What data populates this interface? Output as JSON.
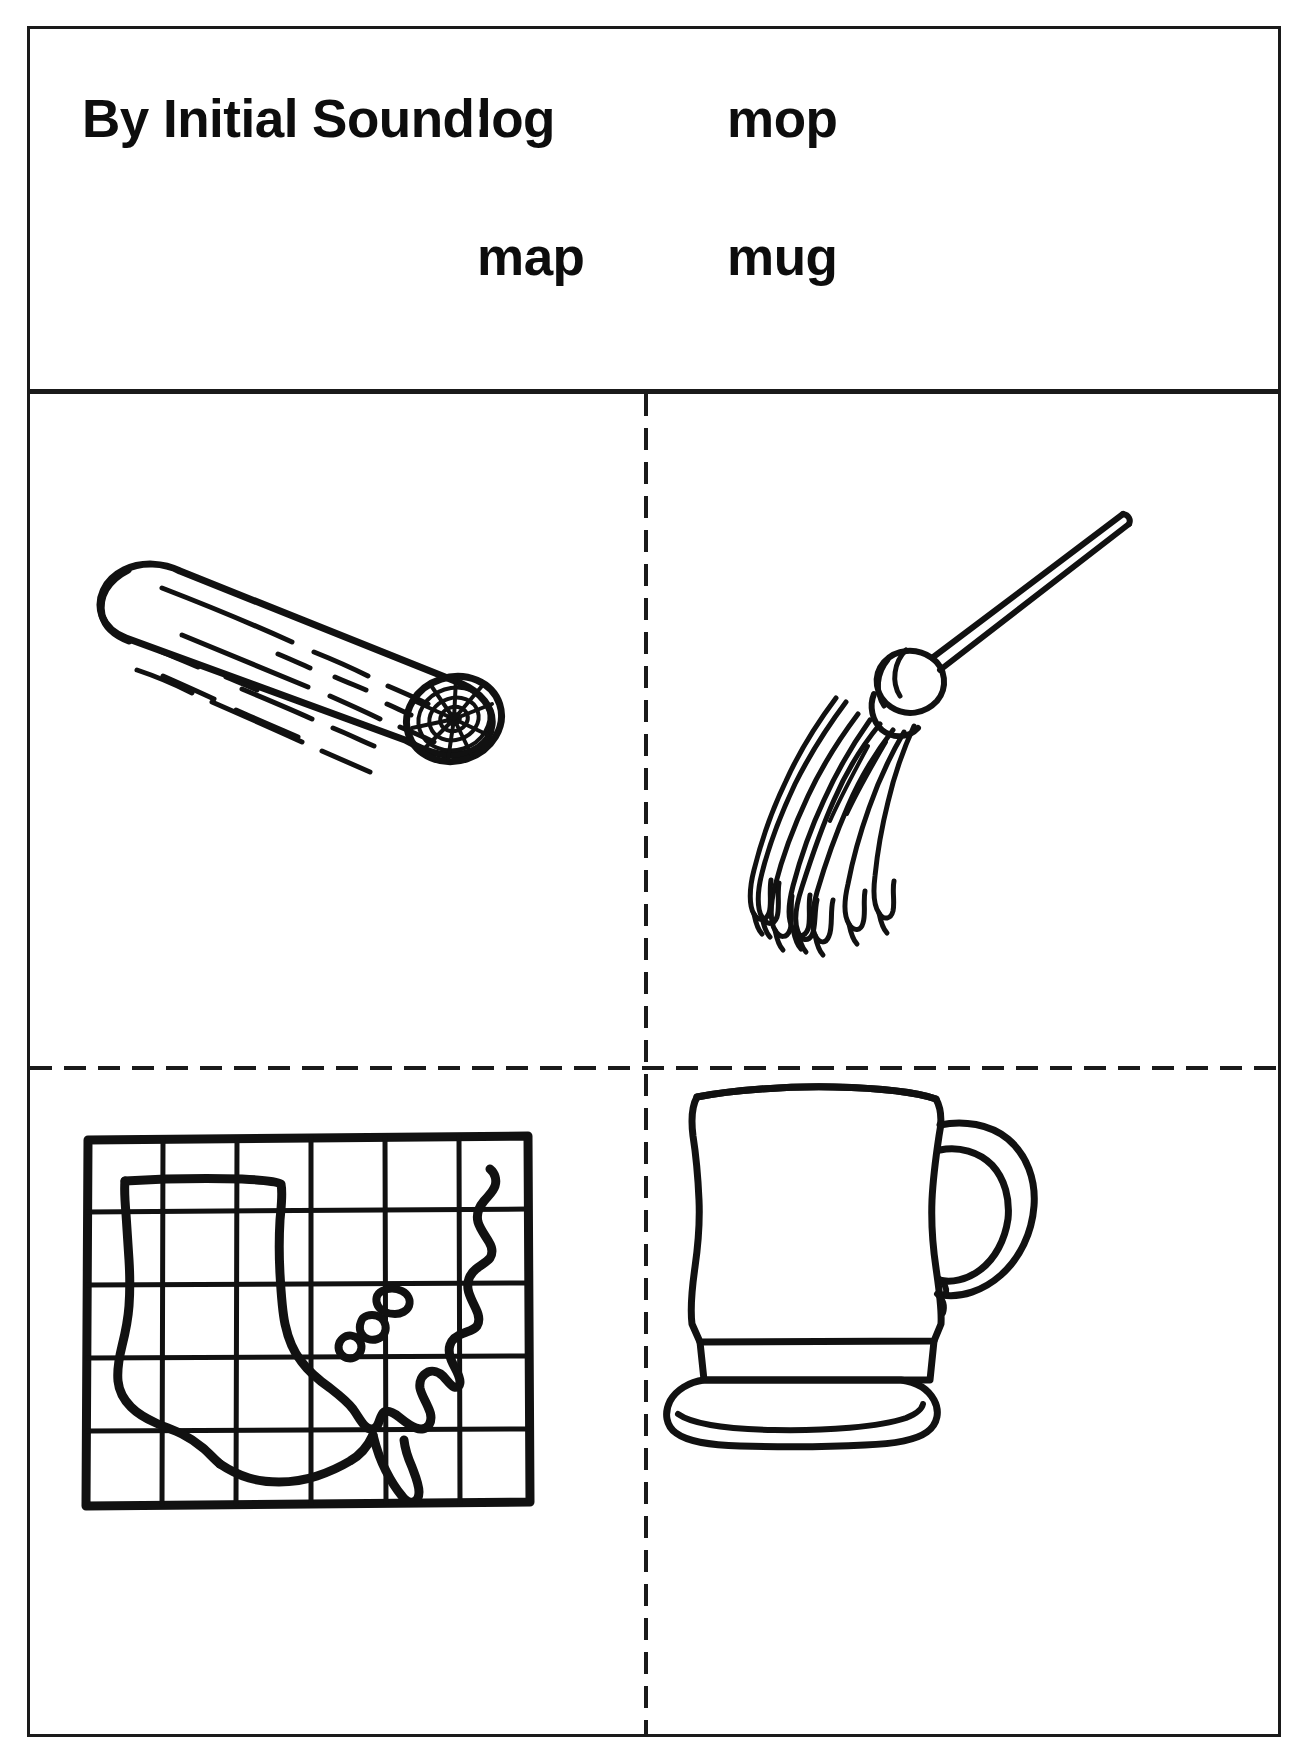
{
  "worksheet": {
    "prompt_label": "By Initial Sound:",
    "words": [
      {
        "id": "log",
        "text": "log"
      },
      {
        "id": "mop",
        "text": "mop"
      },
      {
        "id": "map",
        "text": "map"
      },
      {
        "id": "mug",
        "text": "mug"
      }
    ],
    "word_grid": {
      "row_1": [
        "log",
        "mop"
      ],
      "row_2": [
        "map",
        "mug"
      ]
    },
    "quadrants": [
      {
        "position": "top-left",
        "word": "log",
        "picture": "log-illustration",
        "description": "cut log with bark texture and tree-ring end"
      },
      {
        "position": "top-right",
        "word": "mop",
        "picture": "mop-illustration",
        "description": "mop with long diagonal handle and hanging strands"
      },
      {
        "position": "bottom-left",
        "word": "map",
        "picture": "map-illustration",
        "description": "grid map of the continental United States"
      },
      {
        "position": "bottom-right",
        "word": "mug",
        "picture": "mug-illustration",
        "description": "pedestal mug with curved handle"
      }
    ],
    "colors": {
      "ink": "#1a1a1a",
      "text": "#0d0d0d",
      "paper": "#ffffff"
    },
    "dividers": {
      "header_rule": "solid",
      "column_rule": "dashed",
      "row_rule": "dashed"
    }
  }
}
